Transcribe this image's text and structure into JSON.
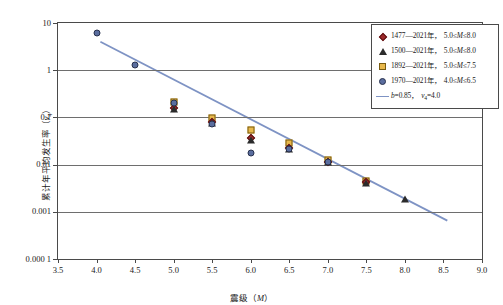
{
  "chart_data": {
    "type": "scatter",
    "title": "",
    "xlabel": "震级（M）",
    "ylabel": "累计年平均发生率（ν₄）",
    "xlim": [
      3.5,
      9.0
    ],
    "ylim": [
      0.0001,
      10
    ],
    "yscale": "log",
    "xticks": [
      "3.5",
      "4.0",
      "4.5",
      "5.0",
      "5.5",
      "6.0",
      "6.5",
      "7.0",
      "7.5",
      "8.0",
      "8.5",
      "9.0"
    ],
    "yticks": [
      "10",
      "1",
      "0.1",
      "0.01",
      "0.001",
      "0.000 1"
    ],
    "grid": "horizontal",
    "legend_position": "top-right",
    "series": [
      {
        "name": "1477—2021年，5.0≤M≤8.0",
        "marker": "diamond",
        "color": "#9e2a2b",
        "points": [
          {
            "x": 5.0,
            "y": 0.155
          },
          {
            "x": 5.5,
            "y": 0.078
          },
          {
            "x": 6.0,
            "y": 0.036
          },
          {
            "x": 6.5,
            "y": 0.023
          },
          {
            "x": 7.0,
            "y": 0.0115
          },
          {
            "x": 7.5,
            "y": 0.0042
          }
        ]
      },
      {
        "name": "1500—2021年，5.0≤M≤8.0",
        "marker": "triangle",
        "color": "#2b2b2b",
        "points": [
          {
            "x": 5.0,
            "y": 0.148
          },
          {
            "x": 5.5,
            "y": 0.075
          },
          {
            "x": 6.0,
            "y": 0.034
          },
          {
            "x": 6.5,
            "y": 0.0215
          },
          {
            "x": 7.0,
            "y": 0.0112
          },
          {
            "x": 7.5,
            "y": 0.004
          },
          {
            "x": 8.0,
            "y": 0.0019
          }
        ]
      },
      {
        "name": "1892—2021年，5.0≤M≤7.5",
        "marker": "square",
        "color": "#e8b84b",
        "points": [
          {
            "x": 5.0,
            "y": 0.215
          },
          {
            "x": 5.5,
            "y": 0.098
          },
          {
            "x": 6.0,
            "y": 0.055
          },
          {
            "x": 6.5,
            "y": 0.028
          },
          {
            "x": 7.0,
            "y": 0.0128
          },
          {
            "x": 7.5,
            "y": 0.0046
          }
        ]
      },
      {
        "name": "1970—2021年，4.0≤M≤6.5",
        "marker": "circle",
        "color": "#5a6d9e",
        "points": [
          {
            "x": 4.0,
            "y": 6.0
          },
          {
            "x": 4.5,
            "y": 1.3
          },
          {
            "x": 5.0,
            "y": 0.205
          },
          {
            "x": 5.5,
            "y": 0.072
          },
          {
            "x": 6.0,
            "y": 0.0175
          },
          {
            "x": 6.5,
            "y": 0.0215
          },
          {
            "x": 7.0,
            "y": 0.0112
          }
        ]
      }
    ],
    "fit_line": {
      "name": "b=0.85，ν₄=4.0",
      "color": "#7e93c4",
      "b": 0.85,
      "nu4": 4.0,
      "x0": 4.05,
      "y0": 4.0,
      "x1": 8.55,
      "y1": 0.00065
    },
    "annotations": []
  },
  "legend": {
    "items": [
      {
        "symbol": "diamond",
        "period": "1477—2021年，",
        "range_lo": "5.0",
        "range_hi": "8.0"
      },
      {
        "symbol": "triangle",
        "period": "1500—2021年，",
        "range_lo": "5.0",
        "range_hi": "8.0"
      },
      {
        "symbol": "square",
        "period": "1892—2021年，",
        "range_lo": "5.0",
        "range_hi": "7.5"
      },
      {
        "symbol": "circle",
        "period": "1970—2021年，",
        "range_lo": "4.0",
        "range_hi": "6.5"
      }
    ],
    "fit_label_b": "b=0.85，",
    "fit_label_nu": "=4.0"
  }
}
